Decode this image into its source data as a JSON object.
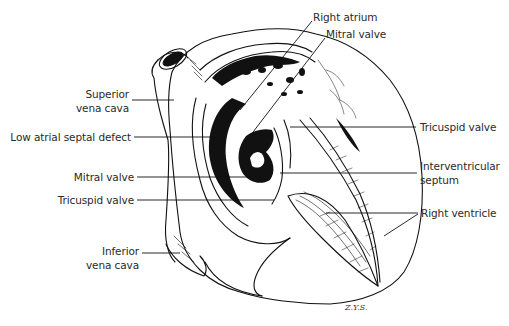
{
  "figure": {
    "signature": "Z.Y.S."
  },
  "labels": [
    {
      "id": "right-atrium",
      "text": "Right atrium",
      "x": 311,
      "y": 17,
      "align": "left"
    },
    {
      "id": "mitral-valve-top",
      "text": "Mitral valve",
      "x": 325,
      "y": 34,
      "align": "left"
    },
    {
      "id": "superior-vena-cava",
      "lines": [
        "Superior",
        "vena cava"
      ],
      "x": 87,
      "y": 88,
      "align": "right"
    },
    {
      "id": "low-atrial-septal-defect",
      "text": "Low atrial septal defect",
      "x": 17,
      "y": 130,
      "align": "right"
    },
    {
      "id": "tricuspid-valve-top",
      "text": "Tricuspid valve",
      "x": 420,
      "y": 121,
      "align": "left"
    },
    {
      "id": "mitral-valve-left",
      "text": "Mitral valve",
      "x": 77,
      "y": 170,
      "align": "right"
    },
    {
      "id": "interventricular-septum",
      "lines": [
        "Interventricular",
        "septum"
      ],
      "x": 420,
      "y": 161,
      "align": "left"
    },
    {
      "id": "tricuspid-valve-left",
      "text": "Tricuspid valve",
      "x": 61,
      "y": 193,
      "align": "right"
    },
    {
      "id": "right-ventricle",
      "text": "Right ventricle",
      "x": 421,
      "y": 205,
      "align": "left"
    },
    {
      "id": "inferior-vena-cava",
      "lines": [
        "Inferior",
        "vena cava"
      ],
      "x": 92,
      "y": 235,
      "align": "right"
    }
  ],
  "colors": {
    "ink": "#111111",
    "label_text": "#2a2a2a",
    "background": "#ffffff"
  }
}
